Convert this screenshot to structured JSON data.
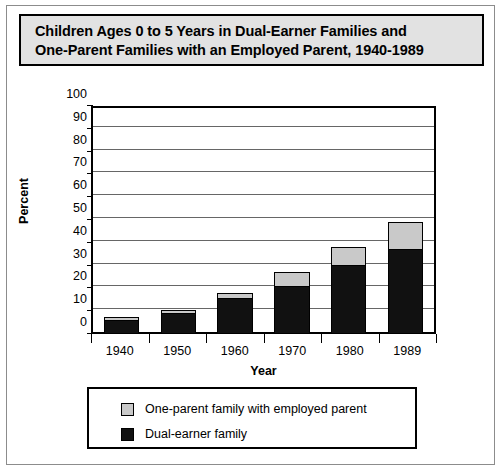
{
  "title": {
    "line1": "Children Ages 0 to 5 Years in Dual-Earner Families and",
    "line2": "One-Parent Families with an Employed Parent, 1940-1989"
  },
  "colors": {
    "dual_earner": "#111111",
    "one_parent": "#c9c9c9",
    "title_background": "#e2e2e2",
    "axis": "#000000",
    "gridline": "#666666"
  },
  "legend": {
    "position": "bottom",
    "entries": [
      {
        "label": "One-parent family with employed parent",
        "swatch": "gray"
      },
      {
        "label": "Dual-earner family",
        "swatch": "black"
      }
    ]
  },
  "chart_data": {
    "type": "bar",
    "stacked": true,
    "title": "Children Ages 0 to 5 Years in Dual-Earner Families and One-Parent Families with an Employed Parent, 1940-1989",
    "xlabel": "Year",
    "ylabel": "Percent",
    "categories": [
      "1940",
      "1950",
      "1960",
      "1970",
      "1980",
      "1989"
    ],
    "ylim": [
      0,
      100
    ],
    "yticks": [
      0,
      10,
      20,
      30,
      40,
      50,
      60,
      70,
      80,
      90,
      100
    ],
    "ytick_labels": [
      "0",
      "10",
      "20",
      "30",
      "40",
      "50",
      "60",
      "70",
      "80",
      "90",
      "100"
    ],
    "grid": true,
    "grid_axis": "y",
    "legend_position": "bottom",
    "series": [
      {
        "name": "Dual-earner family",
        "color": "#111111",
        "values": [
          6,
          9,
          15.5,
          21,
          30,
          37
        ]
      },
      {
        "name": "One-parent family with employed parent",
        "color": "#c9c9c9",
        "values": [
          1.5,
          1.5,
          2.5,
          6,
          8,
          12
        ]
      }
    ],
    "totals": [
      7.5,
      10.5,
      18,
      27,
      38,
      49
    ]
  }
}
